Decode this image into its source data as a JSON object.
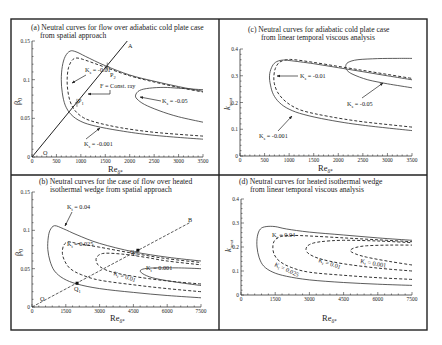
{
  "figure": {
    "panels": {
      "a": {
        "title_line1": "(a) Neutral curves for flow over adiabatic cold plate case",
        "title_line2": "from spatial approach",
        "ylabel": "β",
        "ylabel_sub": "0",
        "xlabel": "Re",
        "xlabel_sub": "δ*",
        "xticks": [
          "0",
          "500",
          "1000",
          "1500",
          "2000",
          "2500",
          "3000",
          "3500"
        ],
        "yticks": [
          "0",
          "0.05",
          "0.1",
          "0.15"
        ],
        "annotations": {
          "k1": "K",
          "k1_sub": "s",
          "k1_val": " = -0.01",
          "k2": "K",
          "k2_sub": "s",
          "k2_val": " = -0.05",
          "k3": "K",
          "k3_sub": "s",
          "k3_val": " = -0.001",
          "ray": "F = Const. ray",
          "ray_end": "A",
          "origin": "O",
          "p1": "P",
          "p1_sub": "1",
          "p2": "P",
          "p2_sub": "2"
        }
      },
      "b": {
        "title_line1": "(b) Neutral curves for the case of flow over heated",
        "title_line2": "isothermal wedge from spatial approach",
        "ylabel": "β",
        "ylabel_sub": "0",
        "xlabel": "Re",
        "xlabel_sub": "δ*",
        "xticks": [
          "0",
          "1500",
          "3000",
          "4500",
          "6000",
          "7500"
        ],
        "yticks": [
          "0",
          "0.05",
          "0.1",
          "0.15"
        ],
        "annotations": {
          "k1": "K",
          "k1_sub": "t",
          "k1_val": " = 0.04",
          "k2": "K",
          "k2_sub": "t",
          "k2_val": " = 0.025",
          "k3": "K",
          "k3_sub": "t",
          "k3_val": " = 0.01",
          "k4": "K",
          "k4_sub": "t",
          "k4_val": " = 0.001",
          "ray_end": "B",
          "origin": "O",
          "q1": "Q",
          "q1_sub": "1",
          "q2": "Q",
          "q2_sub": "2"
        }
      },
      "c": {
        "title_line1": "(c) Neutral curves for adiabatic cold plate case",
        "title_line2": "from linear temporal viscous analysis",
        "ylabel": "k",
        "ylabel_sub": "neut",
        "xlabel": "Re",
        "xlabel_sub": "δ*",
        "xticks": [
          "0",
          "500",
          "1000",
          "1500",
          "2000",
          "2500",
          "3000",
          "3500"
        ],
        "yticks": [
          "0",
          "0.1",
          "0.2",
          "0.3",
          "0.4"
        ],
        "annotations": {
          "k1": "K",
          "k1_sub": "s",
          "k1_val": " = -0.01",
          "k2": "K",
          "k2_sub": "s",
          "k2_val": " = -0.05",
          "k3": "K",
          "k3_sub": "s",
          "k3_val": " = -0.001"
        }
      },
      "d": {
        "title_line1": "(d) Neutral curves for heated isothermal wedge",
        "title_line2": "from linear temporal viscous analysis",
        "ylabel": "k",
        "ylabel_sub": "neut",
        "xlabel": "Re",
        "xlabel_sub": "δ*",
        "xticks": [
          "0",
          "1500",
          "3000",
          "4500",
          "6000",
          "7500"
        ],
        "yticks": [
          "0",
          "0.1",
          "0.2",
          "0.3",
          "0.4"
        ],
        "annotations": {
          "k1": "K",
          "k1_sub": "t",
          "k1_val": " = 0.04",
          "k2": "K",
          "k2_sub": "t",
          "k2_val": " = 0.025",
          "k3": "K",
          "k3_sub": "t",
          "k3_val": " = 0.01",
          "k4": "K",
          "k4_sub": "t",
          "k4_val": " = 0.001"
        }
      }
    }
  },
  "chart_data": [
    {
      "type": "line",
      "title": "(a) Neutral curves for flow over adiabatic cold plate case from spatial approach",
      "xlabel": "Re_δ*",
      "ylabel": "β0",
      "xlim": [
        0,
        3500
      ],
      "ylim": [
        0,
        0.15
      ],
      "grid": false,
      "series": [
        {
          "name": "Ks = -0.001",
          "style": "solid",
          "x": [
            3500,
            2500,
            1800,
            1300,
            1000,
            800,
            680,
            620,
            600,
            620,
            680,
            780,
            900,
            1100,
            1500,
            2000,
            2500,
            3000,
            3500
          ],
          "y": [
            0.023,
            0.028,
            0.034,
            0.04,
            0.046,
            0.055,
            0.067,
            0.083,
            0.1,
            0.117,
            0.13,
            0.137,
            0.136,
            0.13,
            0.118,
            0.106,
            0.098,
            0.091,
            0.085
          ]
        },
        {
          "name": "Ks = -0.01",
          "style": "dashed",
          "x": [
            3500,
            2500,
            1800,
            1300,
            1050,
            880,
            780,
            730,
            720,
            750,
            820,
            920,
            1100,
            1500,
            2000,
            2500,
            3000,
            3500
          ],
          "y": [
            0.027,
            0.032,
            0.038,
            0.045,
            0.051,
            0.06,
            0.072,
            0.087,
            0.102,
            0.116,
            0.125,
            0.128,
            0.125,
            0.116,
            0.105,
            0.097,
            0.09,
            0.084
          ]
        },
        {
          "name": "Ks = -0.05",
          "style": "solid",
          "x": [
            3500,
            3000,
            2600,
            2300,
            2150,
            2120,
            2200,
            2400,
            2700,
            3000,
            3500
          ],
          "y": [
            0.045,
            0.052,
            0.06,
            0.068,
            0.075,
            0.08,
            0.086,
            0.089,
            0.09,
            0.089,
            0.087
          ]
        }
      ],
      "annotations": [
        "Ks = -0.01",
        "Ks = -0.05",
        "Ks = -0.001",
        "F = Const. ray",
        "A",
        "O",
        "P1",
        "P2"
      ],
      "ray": {
        "name": "OA",
        "x": [
          0,
          1950
        ],
        "y": [
          0,
          0.15
        ]
      },
      "points": [
        {
          "name": "P1",
          "x": 920,
          "y": 0.07
        },
        {
          "name": "P2",
          "x": 1540,
          "y": 0.117
        }
      ]
    },
    {
      "type": "line",
      "title": "(c) Neutral curves for adiabatic cold plate case from linear temporal viscous analysis",
      "xlabel": "Re_δ*",
      "ylabel": "k_neut",
      "xlim": [
        0,
        3500
      ],
      "ylim": [
        0,
        0.4
      ],
      "grid": false,
      "series": [
        {
          "name": "Ks = -0.001",
          "style": "solid",
          "x": [
            3500,
            2500,
            1800,
            1300,
            1000,
            800,
            680,
            620,
            600,
            640,
            720,
            850,
            1000,
            1500,
            2000,
            2500,
            3000,
            3500
          ],
          "y": [
            0.095,
            0.115,
            0.135,
            0.155,
            0.175,
            0.2,
            0.23,
            0.265,
            0.3,
            0.33,
            0.35,
            0.358,
            0.357,
            0.345,
            0.33,
            0.315,
            0.3,
            0.285
          ]
        },
        {
          "name": "Ks = -0.01",
          "style": "dashed",
          "x": [
            3500,
            2500,
            1800,
            1300,
            1050,
            880,
            760,
            700,
            690,
            720,
            800,
            950,
            1100,
            1500,
            2000,
            2500,
            3000,
            3500
          ],
          "y": [
            0.108,
            0.128,
            0.148,
            0.168,
            0.188,
            0.212,
            0.24,
            0.27,
            0.3,
            0.328,
            0.35,
            0.36,
            0.36,
            0.35,
            0.335,
            0.32,
            0.305,
            0.29
          ]
        },
        {
          "name": "Ks = -0.05",
          "style": "solid",
          "x": [
            3500,
            3000,
            2600,
            2300,
            2180,
            2150,
            2200,
            2400,
            2800,
            3200,
            3500
          ],
          "y": [
            0.255,
            0.27,
            0.285,
            0.305,
            0.32,
            0.335,
            0.35,
            0.36,
            0.364,
            0.365,
            0.365
          ]
        }
      ],
      "annotations": [
        "Ks = -0.01",
        "Ks = -0.05",
        "Ks = -0.001"
      ]
    },
    {
      "type": "line",
      "title": "(b) Neutral curves for the case of flow over heated isothermal wedge from spatial approach",
      "xlabel": "Re_δ*",
      "ylabel": "β0",
      "xlim": [
        0,
        7500
      ],
      "ylim": [
        0,
        0.15
      ],
      "grid": false,
      "series": [
        {
          "name": "Kt = 0.04",
          "style": "solid",
          "x": [
            7500,
            6000,
            4500,
            3000,
            2000,
            1400,
            1000,
            800,
            700,
            720,
            800,
            1000,
            1400,
            2000,
            3000,
            4500,
            6000,
            7500
          ],
          "y": [
            0.012,
            0.015,
            0.019,
            0.024,
            0.03,
            0.037,
            0.047,
            0.06,
            0.075,
            0.09,
            0.1,
            0.106,
            0.102,
            0.094,
            0.083,
            0.072,
            0.065,
            0.06
          ]
        },
        {
          "name": "Kt = 0.025",
          "style": "dashed",
          "x": [
            7500,
            6000,
            4500,
            3000,
            2200,
            1700,
            1450,
            1350,
            1400,
            1600,
            2000,
            3000,
            4500,
            6000,
            7500
          ],
          "y": [
            0.02,
            0.024,
            0.029,
            0.035,
            0.042,
            0.05,
            0.06,
            0.07,
            0.08,
            0.085,
            0.083,
            0.078,
            0.07,
            0.063,
            0.058
          ]
        },
        {
          "name": "Kt = 0.01",
          "style": "dashed",
          "x": [
            7500,
            6000,
            4500,
            3500,
            3000,
            2850,
            2900,
            3200,
            4000,
            5000,
            6000,
            7500
          ],
          "y": [
            0.03,
            0.034,
            0.04,
            0.046,
            0.053,
            0.06,
            0.066,
            0.07,
            0.069,
            0.065,
            0.06,
            0.055
          ]
        },
        {
          "name": "Kt = 0.001",
          "style": "solid",
          "x": [
            7500,
            6500,
            5500,
            5000,
            4800,
            5000,
            5500,
            6500,
            7500
          ],
          "y": [
            0.028,
            0.032,
            0.037,
            0.042,
            0.047,
            0.05,
            0.051,
            0.051,
            0.05
          ]
        }
      ],
      "annotations": [
        "Kt = 0.04",
        "Kt = 0.025",
        "Kt = 0.01",
        "Kt = 0.001",
        "B",
        "O",
        "Q1",
        "Q2"
      ],
      "ray": {
        "name": "OB",
        "x": [
          0,
          7000
        ],
        "y": [
          0,
          0.11
        ]
      },
      "points": [
        {
          "name": "Q1",
          "x": 2000,
          "y": 0.031
        },
        {
          "name": "Q2",
          "x": 4700,
          "y": 0.074
        }
      ]
    },
    {
      "type": "line",
      "title": "(d) Neutral curves for heated isothermal wedge from linear temporal viscous analysis",
      "xlabel": "Re_δ*",
      "ylabel": "k_neut",
      "xlim": [
        0,
        7500
      ],
      "ylim": [
        0,
        0.4
      ],
      "grid": false,
      "series": [
        {
          "name": "Kt = 0.04",
          "style": "solid",
          "x": [
            7500,
            6000,
            4500,
            3000,
            2000,
            1400,
            1000,
            800,
            700,
            720,
            850,
            1100,
            1500,
            2000,
            3000,
            4500,
            6000,
            7500
          ],
          "y": [
            0.04,
            0.045,
            0.052,
            0.063,
            0.078,
            0.095,
            0.12,
            0.155,
            0.2,
            0.245,
            0.275,
            0.285,
            0.285,
            0.275,
            0.262,
            0.25,
            0.238,
            0.228
          ]
        },
        {
          "name": "Kt = 0.025",
          "style": "dashed",
          "x": [
            7500,
            6000,
            4500,
            3000,
            2200,
            1700,
            1450,
            1400,
            1500,
            1800,
            2300,
            3000,
            4500,
            6000,
            7500
          ],
          "y": [
            0.065,
            0.072,
            0.082,
            0.095,
            0.115,
            0.14,
            0.17,
            0.205,
            0.23,
            0.245,
            0.248,
            0.246,
            0.238,
            0.23,
            0.222
          ]
        },
        {
          "name": "Kt = 0.01",
          "style": "dashed",
          "x": [
            7500,
            6000,
            4500,
            3500,
            3000,
            2850,
            3000,
            3500,
            4500,
            6000,
            7500
          ],
          "y": [
            0.1,
            0.112,
            0.13,
            0.15,
            0.17,
            0.19,
            0.21,
            0.222,
            0.228,
            0.225,
            0.218
          ]
        },
        {
          "name": "Kt = 0.001",
          "style": "dashed",
          "x": [
            7500,
            6500,
            5500,
            5000,
            4800,
            5000,
            5500,
            6500,
            7500
          ],
          "y": [
            0.125,
            0.14,
            0.158,
            0.172,
            0.185,
            0.197,
            0.205,
            0.208,
            0.208
          ]
        }
      ],
      "annotations": [
        "Kt = 0.04",
        "Kt = 0.025",
        "Kt = 0.01",
        "Kt = 0.001"
      ]
    }
  ]
}
